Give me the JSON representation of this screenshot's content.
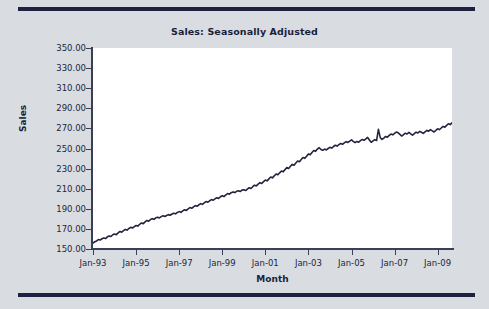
{
  "figure": {
    "background_color": "#d9dde1",
    "rule_color": "#1e2240",
    "plot_background": "#ffffff"
  },
  "chart_data": {
    "type": "line",
    "title": "Sales: Seasonally Adjusted",
    "xlabel": "Month",
    "ylabel": "Sales",
    "grid": false,
    "legend": null,
    "line_color": "#23243d",
    "line_width": 1.6,
    "ylim": [
      150,
      350
    ],
    "ytick_labels": [
      "350.00",
      "330.00",
      "310.00",
      "290.00",
      "270.00",
      "250.00",
      "230.00",
      "210.00",
      "190.00",
      "170.00",
      "150.00"
    ],
    "ytick_values": [
      350,
      330,
      310,
      290,
      270,
      250,
      230,
      210,
      190,
      170,
      150
    ],
    "xtick_labels": [
      "Jan-93",
      "Jan-95",
      "Jan-97",
      "Jan-99",
      "Jan-01",
      "Jan-03",
      "Jan-05",
      "Jan-07",
      "Jan-09"
    ],
    "xtick_values": [
      0,
      24,
      48,
      72,
      96,
      120,
      144,
      168,
      192
    ],
    "xlim": [
      0,
      200
    ],
    "x_start_label": "Jan-93",
    "x_end_label": "Sep-09",
    "series": [
      {
        "name": "Sales",
        "x_unit": "months since Jan-1993",
        "values": [
          156.0,
          157.2,
          158.0,
          159.4,
          158.9,
          160.2,
          161.0,
          160.4,
          162.1,
          163.0,
          162.4,
          164.2,
          165.0,
          164.3,
          166.1,
          167.4,
          166.8,
          168.2,
          169.5,
          168.8,
          170.4,
          171.6,
          170.9,
          172.3,
          173.4,
          172.8,
          174.6,
          175.9,
          175.2,
          177.0,
          178.4,
          177.6,
          179.3,
          180.2,
          179.5,
          181.0,
          181.6,
          180.9,
          182.2,
          183.0,
          182.4,
          183.4,
          184.2,
          183.6,
          184.8,
          185.6,
          185.0,
          186.4,
          187.2,
          186.5,
          188.0,
          189.1,
          188.4,
          190.0,
          191.2,
          190.5,
          192.0,
          193.2,
          192.5,
          194.0,
          195.1,
          194.4,
          196.0,
          197.2,
          196.6,
          198.0,
          199.2,
          198.5,
          200.0,
          201.0,
          200.3,
          202.0,
          203.0,
          202.2,
          203.8,
          205.2,
          204.5,
          206.0,
          206.8,
          206.1,
          207.4,
          208.0,
          207.2,
          208.6,
          209.0,
          208.2,
          209.6,
          211.0,
          210.2,
          212.0,
          213.5,
          212.8,
          214.6,
          216.0,
          215.2,
          217.0,
          218.6,
          217.8,
          219.8,
          221.6,
          220.8,
          222.8,
          224.6,
          223.8,
          225.8,
          227.6,
          226.8,
          229.0,
          231.0,
          230.2,
          232.4,
          234.2,
          233.4,
          235.6,
          237.6,
          236.8,
          239.0,
          241.0,
          240.2,
          242.4,
          244.6,
          243.8,
          246.0,
          248.0,
          247.2,
          249.4,
          250.8,
          249.0,
          248.2,
          249.4,
          248.6,
          250.0,
          251.2,
          250.4,
          252.0,
          253.2,
          252.4,
          253.8,
          255.0,
          254.2,
          255.6,
          256.8,
          256.0,
          257.4,
          258.6,
          257.0,
          255.8,
          257.0,
          256.2,
          257.8,
          259.0,
          258.2,
          259.6,
          261.0,
          258.4,
          256.2,
          257.6,
          258.8,
          258.0,
          269.0,
          261.0,
          259.0,
          260.4,
          262.0,
          261.2,
          263.0,
          264.4,
          263.6,
          265.0,
          266.4,
          265.6,
          264.0,
          262.4,
          263.8,
          265.2,
          264.4,
          266.0,
          264.6,
          263.2,
          264.8,
          266.2,
          265.4,
          267.0,
          266.2,
          265.0,
          266.6,
          268.0,
          267.2,
          268.8,
          267.6,
          266.4,
          268.0,
          269.6,
          268.8,
          270.4,
          272.0,
          271.2,
          273.0,
          274.6,
          273.8,
          275.6,
          277.4,
          276.6,
          278.4,
          280.0,
          279.2,
          281.0,
          279.6,
          278.4,
          280.2,
          282.0,
          281.2,
          283.0,
          284.8,
          284.0,
          286.0,
          288.0,
          287.2,
          289.2,
          291.0,
          290.2,
          292.2,
          291.0,
          290.0,
          292.0,
          294.0,
          293.2,
          295.2,
          297.2,
          296.4,
          298.4,
          300.4,
          299.6,
          302.0,
          304.0,
          303.2,
          305.4,
          310.0,
          308.0,
          309.6,
          311.6,
          310.8,
          312.8,
          314.8,
          314.0,
          316.0,
          318.0,
          317.2,
          319.4,
          321.6,
          320.8,
          323.0,
          322.0,
          324.0,
          326.0,
          325.2,
          327.2,
          326.0,
          325.0,
          327.0,
          329.0,
          328.2,
          330.2,
          331.0,
          330.0,
          332.0,
          334.0,
          333.2,
          335.2,
          337.2,
          336.4,
          338.4,
          340.4,
          339.6,
          341.6,
          343.6,
          342.0,
          344.0,
          346.0,
          344.0,
          342.5,
          344.0,
          343.0,
          342.0,
          343.5,
          345.0,
          344.0,
          343.0,
          344.0,
          343.0,
          344.5,
          344.0,
          343.0,
          336.0,
          328.0,
          320.0,
          312.0,
          306.0,
          303.0,
          305.0,
          302.0,
          299.5,
          298.5,
          301.0,
          303.0,
          302.0,
          304.5,
          304.0
        ]
      }
    ]
  }
}
